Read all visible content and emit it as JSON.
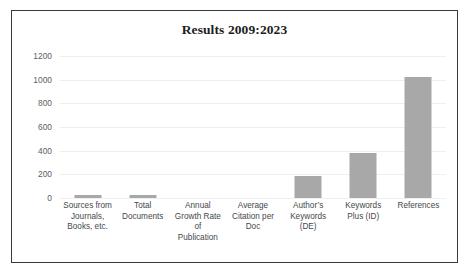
{
  "chart_data": {
    "type": "bar",
    "title": "Results 2009:2023",
    "xlabel": "",
    "ylabel": "",
    "ylim": [
      0,
      1200
    ],
    "grid": true,
    "legend": false,
    "yticks": [
      1200,
      1000,
      800,
      600,
      400,
      200,
      0
    ],
    "ytick_labels": [
      "1200",
      "1000",
      "800",
      "600",
      "400",
      "200",
      "0"
    ],
    "categories": [
      "Sources from Journals, Books, etc.",
      "Total Documents",
      "Annual Growth Rate of Publication",
      "Average Citation per Doc",
      "Author’s Keywords (DE)",
      "Keywords Plus (ID)",
      "References"
    ],
    "category_lines": [
      [
        "Sources from",
        "Journals,",
        "Books, etc."
      ],
      [
        "Total",
        "Documents"
      ],
      [
        "Annual",
        "Growth Rate",
        "of",
        "Publication"
      ],
      [
        "Average",
        "Citation per",
        "Doc"
      ],
      [
        "Author’s",
        "Keywords",
        "(DE)"
      ],
      [
        "Keywords",
        "Plus (ID)"
      ],
      [
        "References"
      ]
    ],
    "values": [
      25,
      28,
      0,
      0,
      185,
      378,
      1020
    ],
    "bar_color": "#a8a8a8"
  },
  "colors": {
    "bar": "#a8a8a8",
    "frame": "#3a3a3a",
    "gridline": "#efefef",
    "tick_text": "#5e5e5e",
    "label_text": "#44484b",
    "title_text": "#1d1d1d",
    "background": "#ffffff"
  }
}
